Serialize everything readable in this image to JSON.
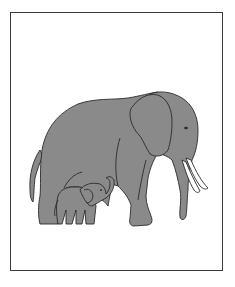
{
  "figure": {
    "subjects": [
      "adult-elephant",
      "baby-elephant"
    ],
    "colors": {
      "fill": "#8a8a8a",
      "outline": "#2a2a2a",
      "tusk": "#ffffff",
      "background": "#ffffff",
      "frame": "#3a3a3a"
    }
  }
}
